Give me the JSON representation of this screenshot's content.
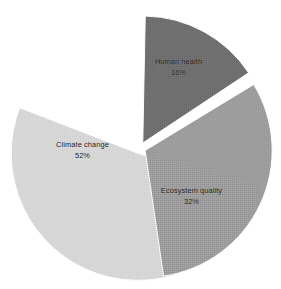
{
  "chart_data": {
    "type": "pie",
    "title": "",
    "subtitle": "",
    "xlabel": "",
    "ylabel": "",
    "grid": false,
    "legend": "none",
    "labels_position": "inside-slice",
    "value_suffix": "%",
    "total": 100,
    "categories": [
      "Climate change",
      "Ecosystem quality",
      "Human health"
    ],
    "values": [
      52,
      32,
      16
    ],
    "slices": [
      {
        "name": "Climate change",
        "label": "Climate change",
        "value": 52,
        "value_label": "52%",
        "color": "#d8d8d8",
        "start_angle": 105,
        "sweep_angle": 187.2,
        "explode": 0.045
      },
      {
        "name": "Ecosystem quality",
        "label": "Ecosystem quality",
        "value": 32,
        "value_label": "32%",
        "color": "#9d9d9d",
        "start_angle": 57.6,
        "sweep_angle": 115.2,
        "explode": 0.045
      },
      {
        "name": "Human health",
        "label": "Human health",
        "value": 16,
        "value_label": "16%",
        "color": "#6e6e6e",
        "start_angle": 0,
        "sweep_angle": 57.6,
        "explode": 0.045
      }
    ],
    "colors": {
      "climate_change": "#d8d8d8",
      "ecosystem_quality": "#9d9d9d",
      "human_health": "#6e6e6e",
      "background": "#ffffff",
      "label_text": "#1d1d1d",
      "slice_gap": "#ffffff"
    },
    "geometry": {
      "center_x": 140,
      "center_y": 148,
      "radius": 127,
      "gap_px": 5
    }
  }
}
